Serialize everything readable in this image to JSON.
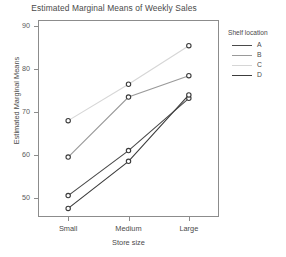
{
  "chart_data": {
    "type": "line",
    "title": "Estimated Marginal Means of Weekly Sales",
    "xlabel": "Store size",
    "ylabel": "Estimated Marginal Means",
    "categories": [
      "Small",
      "Medium",
      "Large"
    ],
    "x_tick_labels": [
      "Small",
      "Medium",
      "Large"
    ],
    "y_tick_labels": [
      "50",
      "60",
      "70",
      "80",
      "90"
    ],
    "y_ticks": [
      50,
      60,
      70,
      80,
      90
    ],
    "ylim": [
      45.5,
      91.5
    ],
    "grid": false,
    "legend": {
      "title": "Shelf location",
      "position": "right",
      "entries": [
        "A",
        "B",
        "C",
        "D"
      ]
    },
    "series": [
      {
        "name": "A",
        "color": "#4a4a4a",
        "values": [
          50.5,
          61.0,
          73.2
        ]
      },
      {
        "name": "B",
        "color": "#9a9a9a",
        "values": [
          59.5,
          73.5,
          78.5
        ]
      },
      {
        "name": "C",
        "color": "#d6d6d6",
        "values": [
          68.0,
          76.5,
          85.5
        ]
      },
      {
        "name": "D",
        "color": "#3c3c3c",
        "values": [
          47.5,
          58.5,
          74.0
        ]
      }
    ],
    "marker": "open-circle",
    "marker_edge_color": "#3a3a3a",
    "marker_face_color": "#ffffff",
    "frame_color": "#8c8c8c",
    "background_color": "#ffffff"
  }
}
